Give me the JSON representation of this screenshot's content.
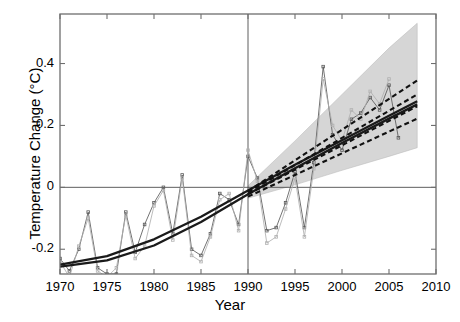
{
  "chart_data": {
    "type": "line",
    "title": "",
    "xlabel": "Year",
    "ylabel": "Temperature Change (°C)",
    "xlim": [
      1970,
      2010
    ],
    "ylim": [
      -0.28,
      0.56
    ],
    "xticks": [
      1970,
      1975,
      1980,
      1985,
      1990,
      1995,
      2000,
      2005,
      2010
    ],
    "xtick_labels": [
      "1970",
      "1975",
      "1980",
      "1985",
      "1990",
      "1995",
      "2000",
      "2005",
      "2010"
    ],
    "yticks": [
      -0.2,
      0,
      0.2,
      0.4
    ],
    "ytick_labels": [
      "-0.2",
      "0",
      "0.2",
      "0.4"
    ],
    "grid": false,
    "legend": "none",
    "annotations": {
      "zero_line_y": 0,
      "vertical_divider_x": 1990,
      "divider_note": "vertical reference line at 1990 separating fitted period from projection period"
    },
    "series": [
      {
        "name": "Observed series A (dark gray, markers)",
        "style": "jagged line with small square markers, dark gray",
        "color": "#5a5a5a",
        "x": [
          1970,
          1971,
          1972,
          1973,
          1974,
          1975,
          1976,
          1977,
          1978,
          1979,
          1980,
          1981,
          1982,
          1983,
          1984,
          1985,
          1986,
          1987,
          1988,
          1989,
          1990,
          1991,
          1992,
          1993,
          1994,
          1995,
          1996,
          1997,
          1998,
          1999,
          2000,
          2001,
          2002,
          2003,
          2004,
          2005,
          2006
        ],
        "values": [
          -0.23,
          -0.27,
          -0.2,
          -0.08,
          -0.26,
          -0.28,
          -0.28,
          -0.08,
          -0.21,
          -0.12,
          -0.05,
          0.0,
          -0.15,
          0.04,
          -0.2,
          -0.22,
          -0.15,
          -0.02,
          -0.04,
          -0.12,
          0.1,
          0.03,
          -0.14,
          -0.13,
          -0.05,
          0.05,
          -0.13,
          0.08,
          0.39,
          0.17,
          0.12,
          0.22,
          0.24,
          0.29,
          0.25,
          0.33,
          0.16
        ]
      },
      {
        "name": "Observed series B (light gray, markers)",
        "style": "jagged line with small square markers, light gray",
        "color": "#b0b0b0",
        "x": [
          1970,
          1971,
          1972,
          1973,
          1974,
          1975,
          1976,
          1977,
          1978,
          1979,
          1980,
          1981,
          1982,
          1983,
          1984,
          1985,
          1986,
          1987,
          1988,
          1989,
          1990,
          1991,
          1992,
          1993,
          1994,
          1995,
          1996,
          1997,
          1998,
          1999,
          2000,
          2001,
          2002,
          2003,
          2004,
          2005
        ],
        "values": [
          -0.24,
          -0.29,
          -0.19,
          -0.1,
          -0.27,
          -0.29,
          -0.26,
          -0.09,
          -0.23,
          -0.19,
          -0.06,
          -0.01,
          -0.17,
          0.03,
          -0.22,
          -0.24,
          -0.16,
          -0.04,
          -0.02,
          -0.14,
          0.12,
          0.02,
          -0.18,
          -0.16,
          -0.07,
          0.03,
          -0.16,
          0.06,
          0.35,
          0.2,
          0.15,
          0.25,
          0.22,
          0.31,
          0.27,
          0.35
        ]
      },
      {
        "name": "Fitted trend 1 (solid, thick)",
        "style": "smooth solid black curve over fitted period extended as straight projection",
        "color": "#1a1a1a",
        "x": [
          1970,
          1975,
          1980,
          1985,
          1990,
          1995,
          2000,
          2005,
          2008
        ],
        "values": [
          -0.25,
          -0.222,
          -0.168,
          -0.095,
          -0.01,
          0.073,
          0.152,
          0.231,
          0.278
        ]
      },
      {
        "name": "Fitted trend 2 (solid, thick)",
        "style": "smooth solid black curve, slightly offset from trend 1",
        "color": "#1a1a1a",
        "x": [
          1970,
          1975,
          1980,
          1985,
          1990,
          1995,
          2000,
          2005,
          2008
        ],
        "values": [
          -0.256,
          -0.236,
          -0.188,
          -0.112,
          -0.022,
          0.062,
          0.143,
          0.222,
          0.268
        ]
      },
      {
        "name": "Projection upper (dashed)",
        "style": "dashed black line from 1990 to 2008",
        "color": "#111111",
        "x": [
          1990,
          2008
        ],
        "values": [
          -0.012,
          0.345
        ]
      },
      {
        "name": "Projection mid-upper (dashed)",
        "style": "dashed black line from 1990 to 2008",
        "color": "#111111",
        "x": [
          1990,
          2008
        ],
        "values": [
          -0.016,
          0.3
        ]
      },
      {
        "name": "Projection mid-lower (dashed)",
        "style": "dashed black line from 1990 to 2008",
        "color": "#111111",
        "x": [
          1990,
          2008
        ],
        "values": [
          -0.022,
          0.262
        ]
      },
      {
        "name": "Projection lower (dashed)",
        "style": "dashed black line from 1990 to 2008",
        "color": "#111111",
        "x": [
          1990,
          2008
        ],
        "values": [
          -0.03,
          0.222
        ]
      }
    ],
    "uncertainty_band": {
      "name": "Projection uncertainty envelope",
      "style": "light gray shaded fan widening after 1990",
      "color": "#d6d6d6",
      "x": [
        1990,
        1995,
        2000,
        2005,
        2008
      ],
      "upper": [
        0.005,
        0.15,
        0.3,
        0.45,
        0.53
      ],
      "lower": [
        -0.035,
        0.008,
        0.055,
        0.1,
        0.128
      ]
    }
  }
}
